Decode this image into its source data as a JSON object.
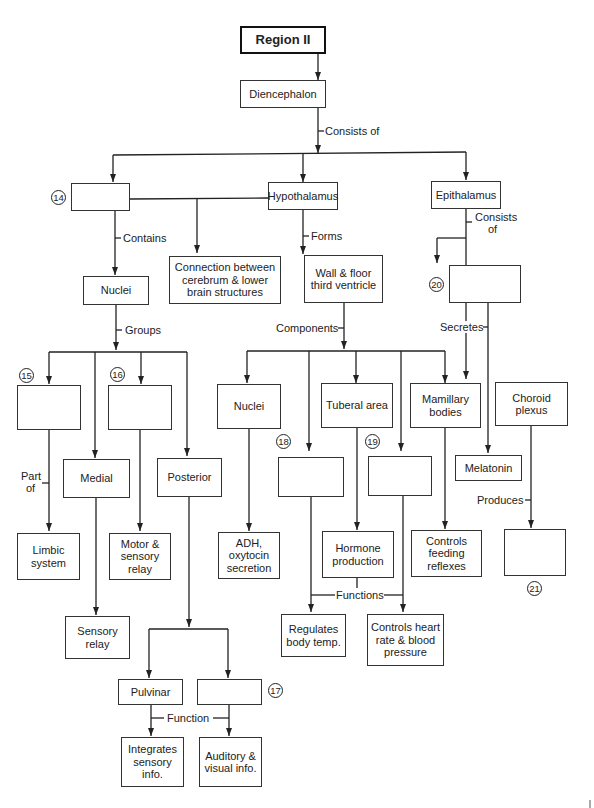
{
  "diagram": {
    "title": "Region II",
    "nodes": {
      "diencephalon": "Diencephalon",
      "blank14": "",
      "hypothalamus": "Hypothalamus",
      "epithalamus": "Epithalamus",
      "nuclei_thal": "Nuclei",
      "connection": "Connection between cerebrum & lower brain structures",
      "wall_floor": "Wall & floor third ventricle",
      "blank20": "",
      "blank15": "",
      "blank16": "",
      "medial": "Medial",
      "posterior": "Posterior",
      "nuclei_hypo": "Nuclei",
      "tuberal": "Tuberal area",
      "mamillary": "Mamillary bodies",
      "choroid": "Choroid plexus",
      "blank18": "",
      "blank19": "",
      "melatonin": "Melatonin",
      "limbic": "Limbic system",
      "motor_sensory": "Motor & sensory relay",
      "adh": "ADH, oxytocin secretion",
      "hormone": "Hormone production",
      "feeding": "Controls feeding reflexes",
      "blank21": "",
      "sensory_relay": "Sensory relay",
      "regulates": "Regulates body temp.",
      "heart": "Controls heart rate & blood pressure",
      "pulvinar": "Pulvinar",
      "blank17": "",
      "integrates": "Integrates sensory info.",
      "auditory": "Auditory & visual info."
    },
    "edge_labels": {
      "consists_of": "Consists of",
      "contains": "Contains",
      "forms": "Forms",
      "epi_consists": "Consists",
      "epi_of": "of",
      "groups": "Groups",
      "components": "Components",
      "secretes": "Secretes",
      "part": "Part",
      "of": "of",
      "produces": "Produces",
      "functions": "Functions",
      "function": "Function"
    },
    "numbers": {
      "n14": "14",
      "n15": "15",
      "n16": "16",
      "n17": "17",
      "n18": "18",
      "n19": "19",
      "n20": "20",
      "n21": "21"
    }
  }
}
